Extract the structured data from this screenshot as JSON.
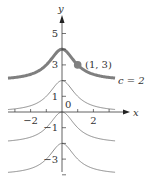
{
  "chart_data": {
    "type": "line",
    "title": "",
    "xlabel": "x",
    "ylabel": "y",
    "xlim": [
      -3.4,
      3.4
    ],
    "ylim": [
      -3.5,
      5.8
    ],
    "grid": false,
    "function_family": "y = c + 2/(1 + x^2)",
    "x_ticks": [
      -3,
      -2,
      -1,
      1,
      2,
      3
    ],
    "x_tick_labels": [
      {
        "value": -2,
        "label": "−2"
      },
      {
        "value": 2,
        "label": "2"
      }
    ],
    "y_ticks": [
      5,
      4,
      3,
      2,
      1,
      -1,
      -2,
      -3,
      -4
    ],
    "y_tick_labels": [
      {
        "value": 5,
        "label": "5"
      },
      {
        "value": 3,
        "label": "3"
      },
      {
        "value": 1,
        "label": "1"
      },
      {
        "value": -1,
        "label": "−1"
      },
      {
        "value": -3,
        "label": "−3"
      }
    ],
    "origin_label": "0",
    "series": [
      {
        "name": "c = 2",
        "c": 2,
        "highlighted": true,
        "peak": [
          0,
          4
        ]
      },
      {
        "name": "c = 0",
        "c": 0,
        "highlighted": false,
        "peak": [
          0,
          2
        ]
      },
      {
        "name": "c = -2",
        "c": -2,
        "highlighted": false,
        "peak": [
          0,
          0
        ]
      },
      {
        "name": "c = -4",
        "c": -4,
        "highlighted": false,
        "peak": [
          0,
          -2
        ]
      }
    ],
    "annotations": [
      {
        "type": "point",
        "x": 1,
        "y": 3,
        "label": "(1, 3)"
      },
      {
        "type": "curve-label",
        "text": "c = 2"
      }
    ],
    "colors": {
      "highlight_curve": "#7f7f7f",
      "thin_curve": "#8c8c8c",
      "axis": "#3a3a3a",
      "point": "#808080"
    }
  }
}
